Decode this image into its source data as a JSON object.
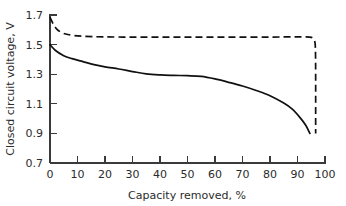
{
  "chart_data": {
    "type": "line",
    "title": "",
    "xlabel": "Capacity removed, %",
    "ylabel": "Closed circuit voltage, V",
    "xlim": [
      0,
      100
    ],
    "ylim": [
      0.7,
      1.7
    ],
    "xticks": [
      0,
      10,
      20,
      30,
      40,
      50,
      60,
      70,
      80,
      90,
      100
    ],
    "xtick_labels": [
      "0",
      "10",
      "20",
      "30",
      "40",
      "50",
      "60",
      "70",
      "80",
      "90",
      "100"
    ],
    "yticks": [
      0.7,
      0.9,
      1.1,
      1.3,
      1.5,
      1.7
    ],
    "ytick_labels": [
      "0.7",
      "0.9",
      "1.1",
      "1.3",
      "1.5",
      "1.7"
    ],
    "grid": false,
    "legend": "none",
    "line_color": "#101010",
    "series": [
      {
        "name": "solid-curve",
        "style": "solid",
        "x": [
          0,
          2,
          5,
          8,
          12,
          16,
          20,
          25,
          30,
          35,
          40,
          45,
          50,
          55,
          60,
          65,
          70,
          75,
          80,
          85,
          88,
          91,
          93,
          94.5
        ],
        "y": [
          1.5,
          1.46,
          1.425,
          1.405,
          1.385,
          1.365,
          1.35,
          1.335,
          1.318,
          1.302,
          1.295,
          1.292,
          1.29,
          1.285,
          1.268,
          1.245,
          1.22,
          1.19,
          1.155,
          1.105,
          1.065,
          1.005,
          0.955,
          0.9
        ]
      },
      {
        "name": "dashed-curve",
        "style": "dashed",
        "x": [
          0,
          1,
          2,
          3,
          5,
          8,
          12,
          20,
          30,
          40,
          50,
          60,
          70,
          80,
          88,
          92,
          94.5,
          95.5,
          96.2,
          96.5,
          96.6,
          96.6
        ],
        "y": [
          1.685,
          1.645,
          1.615,
          1.595,
          1.575,
          1.563,
          1.556,
          1.552,
          1.551,
          1.551,
          1.551,
          1.551,
          1.551,
          1.551,
          1.552,
          1.552,
          1.551,
          1.545,
          1.525,
          1.48,
          1.3,
          0.9
        ]
      }
    ]
  }
}
